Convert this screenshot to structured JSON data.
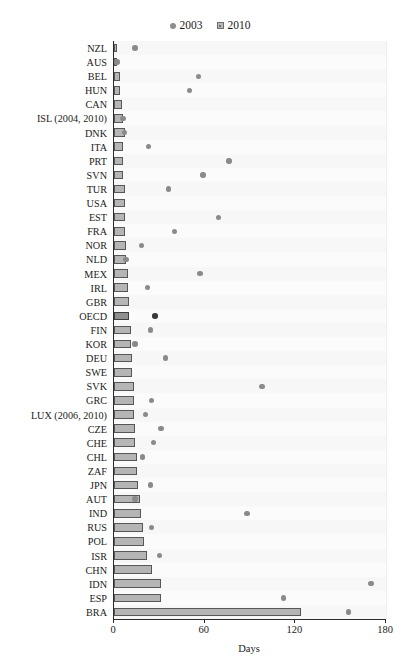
{
  "chart_data": {
    "type": "bar",
    "title": "",
    "xlabel": "Days",
    "ylabel": "",
    "xlim": [
      0,
      180
    ],
    "xticks": [
      0,
      60,
      120,
      180
    ],
    "grid": true,
    "legend_position": "top-center",
    "orientation": "horizontal",
    "legend": [
      {
        "name": "2003",
        "marker": "circle",
        "color": "#8a8a8a"
      },
      {
        "name": "2010",
        "marker": "square",
        "color": "#b5b5b5"
      }
    ],
    "categories": [
      "NZL",
      "AUS",
      "BEL",
      "HUN",
      "CAN",
      "ISL (2004, 2010)",
      "DNK",
      "ITA",
      "PRT",
      "SVN",
      "TUR",
      "USA",
      "EST",
      "FRA",
      "NOR",
      "NLD",
      "MEX",
      "IRL",
      "GBR",
      "OECD",
      "FIN",
      "KOR",
      "DEU",
      "SWE",
      "SVK",
      "GRC",
      "LUX (2006, 2010)",
      "CZE",
      "CHE",
      "CHL",
      "ZAF",
      "JPN",
      "AUT",
      "IND",
      "RUS",
      "POL",
      "ISR",
      "CHN",
      "IDN",
      "ESP",
      "BRA"
    ],
    "series": [
      {
        "name": "2010",
        "marker": "square",
        "values": [
          1,
          2,
          4,
          4,
          5,
          6,
          7,
          6,
          6,
          6,
          7,
          7,
          7,
          7,
          8,
          8,
          9,
          9,
          10,
          10,
          11,
          11,
          12,
          12,
          13,
          13,
          13,
          14,
          14,
          15,
          15,
          16,
          17,
          18,
          19,
          20,
          22,
          25,
          31,
          31,
          124
        ]
      },
      {
        "name": "2003",
        "marker": "circle",
        "values": [
          14,
          2,
          56,
          50,
          null,
          6,
          7,
          23,
          76,
          59,
          36,
          null,
          69,
          40,
          18,
          8,
          57,
          22,
          null,
          27,
          24,
          14,
          34,
          null,
          98,
          25,
          21,
          31,
          26,
          19,
          null,
          24,
          14,
          88,
          25,
          null,
          30,
          null,
          170,
          112,
          155
        ]
      }
    ],
    "highlight_category": "OECD"
  },
  "axis": {
    "x_title": "Days",
    "tick_labels": [
      "0",
      "60",
      "120",
      "180"
    ]
  }
}
